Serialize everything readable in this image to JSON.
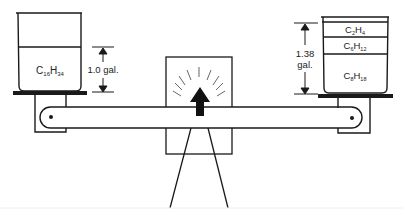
{
  "diagram": {
    "left_pan": {
      "compound": {
        "base": "C",
        "sub1": "16",
        "mid": "H",
        "sub2": "34"
      },
      "volume_label": "1.0 gal."
    },
    "right_pan": {
      "layers": [
        {
          "base": "C",
          "sub1": "2",
          "mid": "H",
          "sub2": "4"
        },
        {
          "base": "C",
          "sub1": "6",
          "mid": "H",
          "sub2": "12"
        },
        {
          "base": "C",
          "sub1": "8",
          "mid": "H",
          "sub2": "18"
        }
      ],
      "volume_label_line1": "1.38",
      "volume_label_line2": "gal."
    },
    "indicator": {
      "icon": "up-arrow-icon",
      "state": "balanced"
    },
    "colors": {
      "ink": "#1a1a1a",
      "background": "#ffffff"
    }
  }
}
